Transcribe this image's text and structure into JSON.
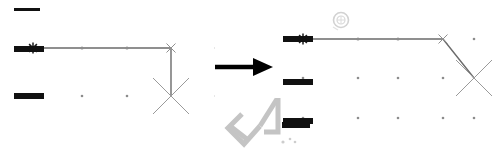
{
  "figure": {
    "type": "before-after-diagram",
    "background_color": "#ffffff",
    "width": 496,
    "height": 154
  },
  "colors": {
    "bar_dark": "#111111",
    "path_line": "#6b6b6b",
    "marker_gray": "#9a9a9a",
    "grid_dot": "#8c8c8c",
    "arrow": "#000000",
    "watermark": "#c9c9c9",
    "logo": "#d8d8d8"
  },
  "transition": {
    "arrow_label": "transforms-to",
    "direction": "right"
  },
  "panels": [
    {
      "id": "before",
      "name": "before-panel",
      "label": "",
      "bars": [
        {
          "name": "bar-top",
          "x": 14,
          "y": 8,
          "w": 26,
          "h": 3
        },
        {
          "name": "bar-middle",
          "x": 14,
          "y": 46,
          "w": 30,
          "h": 6
        },
        {
          "name": "bar-bottom",
          "x": 14,
          "y": 93,
          "w": 30,
          "h": 6
        },
        {
          "name": "bar-right",
          "x": 215,
          "y": 67,
          "w": 30,
          "h": 5
        }
      ],
      "path": {
        "name": "path-polyline",
        "points": "33,48 171,48 171,95",
        "stroke_width": 1.4
      },
      "markers": [
        {
          "name": "marker-start-asterisk",
          "type": "asterisk",
          "x": 33,
          "y": 48,
          "size": 11,
          "color": "#1a1a1a"
        },
        {
          "name": "marker-waypoint-1",
          "type": "dot",
          "x": 82,
          "y": 48,
          "size": 1.6
        },
        {
          "name": "marker-waypoint-2",
          "type": "dot",
          "x": 127,
          "y": 48,
          "size": 1.6
        },
        {
          "name": "marker-corner-x",
          "type": "x",
          "x": 171,
          "y": 48,
          "size": 9,
          "color": "#8f8f8f"
        },
        {
          "name": "marker-goal-x",
          "type": "x",
          "x": 171,
          "y": 96,
          "size": 36,
          "color": "#9a9a9a"
        }
      ],
      "grid_dots": [
        {
          "x": 82,
          "y": 96
        },
        {
          "x": 127,
          "y": 96
        },
        {
          "x": 216,
          "y": 48
        },
        {
          "x": 216,
          "y": 96
        }
      ]
    },
    {
      "id": "after",
      "name": "after-panel",
      "label": "",
      "bars": [
        {
          "name": "bar-start",
          "x": 13,
          "y": 36,
          "w": 30,
          "h": 6
        },
        {
          "name": "bar-middle",
          "x": 13,
          "y": 79,
          "w": 30,
          "h": 6
        },
        {
          "name": "bar-bottom",
          "x": 13,
          "y": 118,
          "w": 30,
          "h": 6
        }
      ],
      "path": {
        "name": "path-polyline",
        "points": "33,39 173,39 204,78",
        "stroke_width": 1.4
      },
      "markers": [
        {
          "name": "marker-start-asterisk",
          "type": "asterisk",
          "x": 33,
          "y": 39,
          "size": 11,
          "color": "#1a1a1a"
        },
        {
          "name": "marker-waypoint-1",
          "type": "dot",
          "x": 88,
          "y": 39,
          "size": 1.6
        },
        {
          "name": "marker-waypoint-2",
          "type": "dot",
          "x": 128,
          "y": 39,
          "size": 1.6
        },
        {
          "name": "marker-corner-x",
          "type": "x",
          "x": 173,
          "y": 39,
          "size": 9,
          "color": "#8f8f8f"
        },
        {
          "name": "marker-goal-x",
          "type": "x",
          "x": 204,
          "y": 78,
          "size": 36,
          "color": "#9a9a9a"
        }
      ],
      "grid_dots": [
        {
          "x": 204,
          "y": 39
        },
        {
          "x": 33,
          "y": 78
        },
        {
          "x": 88,
          "y": 78
        },
        {
          "x": 128,
          "y": 78
        },
        {
          "x": 173,
          "y": 78
        },
        {
          "x": 33,
          "y": 118
        },
        {
          "x": 88,
          "y": 118
        },
        {
          "x": 128,
          "y": 118
        },
        {
          "x": 173,
          "y": 118
        },
        {
          "x": 204,
          "y": 118
        }
      ]
    }
  ],
  "watermark": {
    "name": "corner-watermark",
    "text": ""
  },
  "logo": {
    "name": "circle-logo-watermark",
    "text": ""
  }
}
